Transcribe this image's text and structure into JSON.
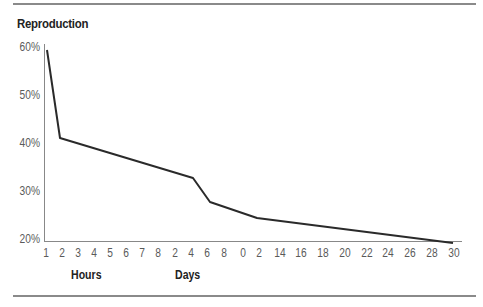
{
  "chart_data": {
    "type": "line",
    "title": "Reproduction",
    "xlabel": "",
    "ylabel": "",
    "ylim": [
      20,
      60
    ],
    "y_ticks": [
      "60%",
      "50%",
      "40%",
      "30%",
      "20%"
    ],
    "x_tick_labels": [
      "1",
      "2",
      "3",
      "4",
      "5",
      "6",
      "7",
      "8",
      "2",
      "4",
      "6",
      "8",
      "0",
      "2",
      "14",
      "16",
      "18",
      "20",
      "22",
      "24",
      "26",
      "28",
      "30"
    ],
    "x_groups": [
      {
        "label": "Hours",
        "range": "1–8"
      },
      {
        "label": "Days",
        "range": "2–30"
      }
    ],
    "grid": false,
    "legend": null,
    "series": [
      {
        "name": "Reproduction",
        "x": [
          "1 hour",
          "2 hours",
          "4 days",
          "6 days",
          "12 days",
          "30 days"
        ],
        "values": [
          59,
          41,
          33,
          28,
          25,
          19.5
        ]
      }
    ]
  },
  "title": "Reproduction",
  "y_axis": {
    "ticks": [
      {
        "label": "60%",
        "y": 48
      },
      {
        "label": "50%",
        "y": 96
      },
      {
        "label": "40%",
        "y": 144
      },
      {
        "label": "30%",
        "y": 192
      },
      {
        "label": "20%",
        "y": 240
      }
    ]
  },
  "x_axis": {
    "ticks": [
      {
        "label": "1",
        "x": 46
      },
      {
        "label": "2",
        "x": 62
      },
      {
        "label": "3",
        "x": 78
      },
      {
        "label": "4",
        "x": 94
      },
      {
        "label": "5",
        "x": 110
      },
      {
        "label": "6",
        "x": 126
      },
      {
        "label": "7",
        "x": 142
      },
      {
        "label": "8",
        "x": 158
      },
      {
        "label": "2",
        "x": 175
      },
      {
        "label": "4",
        "x": 191
      },
      {
        "label": "6",
        "x": 207
      },
      {
        "label": "8",
        "x": 224
      },
      {
        "label": "0",
        "x": 243
      },
      {
        "label": "2",
        "x": 259
      },
      {
        "label": "14",
        "x": 280
      },
      {
        "label": "16",
        "x": 301
      },
      {
        "label": "18",
        "x": 323
      },
      {
        "label": "20",
        "x": 345
      },
      {
        "label": "22",
        "x": 367
      },
      {
        "label": "24",
        "x": 388
      },
      {
        "label": "26",
        "x": 410
      },
      {
        "label": "28",
        "x": 432
      },
      {
        "label": "30",
        "x": 454
      }
    ],
    "groups": [
      {
        "label": "Hours",
        "x": 71
      },
      {
        "label": "Days",
        "x": 175
      }
    ]
  },
  "line": {
    "color": "#2a2a2a",
    "points": "47,50 60,138 193,178 210,202 257,218 453,243"
  }
}
